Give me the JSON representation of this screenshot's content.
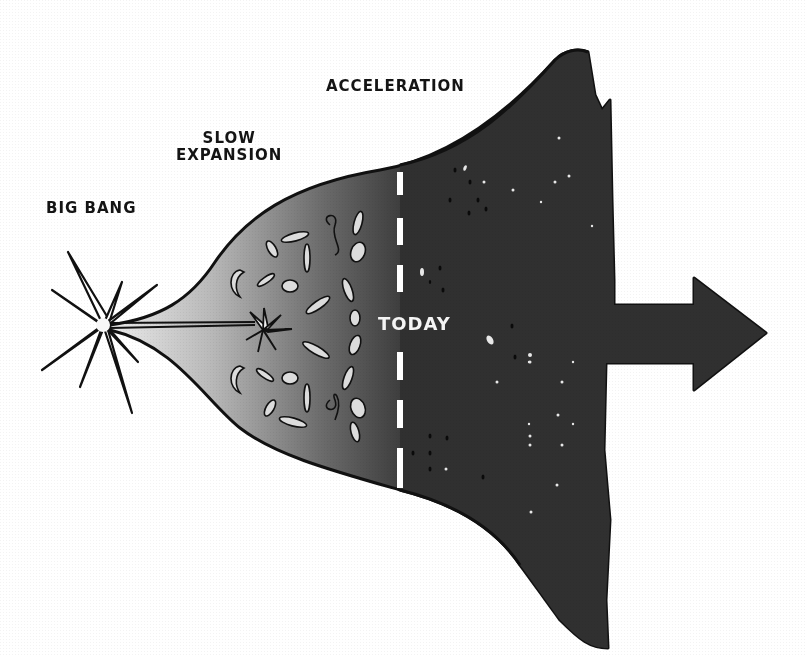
{
  "diagram": {
    "labels": {
      "big_bang": "Big Bang",
      "slow_expansion_line1": "Slow",
      "slow_expansion_line2": "Expansion",
      "acceleration": "Acceleration",
      "today": "Today"
    },
    "stages": [
      {
        "name": "Big Bang",
        "position": "left"
      },
      {
        "name": "Slow Expansion",
        "position": "middle-left"
      },
      {
        "name": "Acceleration",
        "position": "right"
      },
      {
        "name": "Today",
        "position": "dashed divider"
      }
    ],
    "colors": {
      "background": "#ffffff",
      "outline": "#111111",
      "gradient_start": "#e6e6e6",
      "gradient_mid": "#8a8a8a",
      "gradient_end": "#333333",
      "dark_region": "#2f2f2f",
      "today_line": "#ffffff",
      "text": "#141414",
      "today_text": "#f4f4f4"
    },
    "arrow": {
      "direction": "right",
      "meaning": "continued expansion"
    }
  }
}
